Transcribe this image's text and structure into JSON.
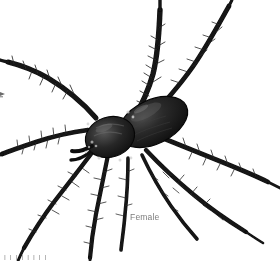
{
  "figure": {
    "width": 280,
    "height": 261,
    "background_color": "#ffffff",
    "subject_description": "Dark hairy spider viewed from above, body at center-left, eight long legs radiating outward and cropped by the image edges",
    "ink_color": "#1a1a1a",
    "body_color": "#141414",
    "highlight_color": "#6d6d6d"
  },
  "caption": {
    "label": "Female",
    "color": "#7c7c7c"
  },
  "clipped_footer": {
    "text": "l l l l l l l l",
    "color": "#9a9a9a"
  },
  "anatomy": {
    "abdomen": "abdomen",
    "cephalothorax": "cephalothorax",
    "legs": [
      "leg-left-front",
      "leg-left-second",
      "leg-left-third",
      "leg-left-rear",
      "leg-right-front",
      "leg-right-second",
      "leg-right-third",
      "leg-right-rear"
    ],
    "pedipalp": "pedipalp"
  }
}
